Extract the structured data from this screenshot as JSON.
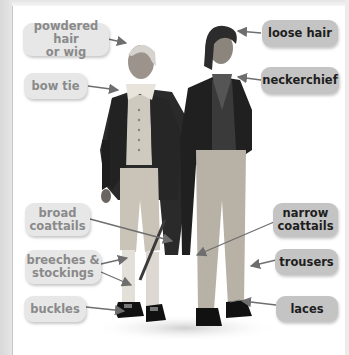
{
  "figure": {
    "colors": {
      "left_label_bg": "#e7e7e7",
      "left_label_text": "#8a8a8a",
      "right_label_bg": "#c4c4c4",
      "right_label_text": "#1e1e1e",
      "arrow": "#6e6e6e"
    },
    "left_labels": [
      {
        "id": "powdered-hair",
        "text": "powdered hair\nor wig",
        "line1": "powdered hair",
        "line2": "or wig"
      },
      {
        "id": "bow-tie",
        "text": "bow tie"
      },
      {
        "id": "broad-coattails",
        "line1": "broad",
        "line2": "coattails"
      },
      {
        "id": "breeches-stockings",
        "line1": "breeches &",
        "line2": "stockings"
      },
      {
        "id": "buckles",
        "text": "buckles"
      }
    ],
    "right_labels": [
      {
        "id": "loose-hair",
        "text": "loose hair"
      },
      {
        "id": "neckerchief",
        "text": "neckerchief"
      },
      {
        "id": "narrow-coattails",
        "line1": "narrow",
        "line2": "coattails"
      },
      {
        "id": "trousers",
        "text": "trousers"
      },
      {
        "id": "laces",
        "text": "laces"
      }
    ]
  }
}
